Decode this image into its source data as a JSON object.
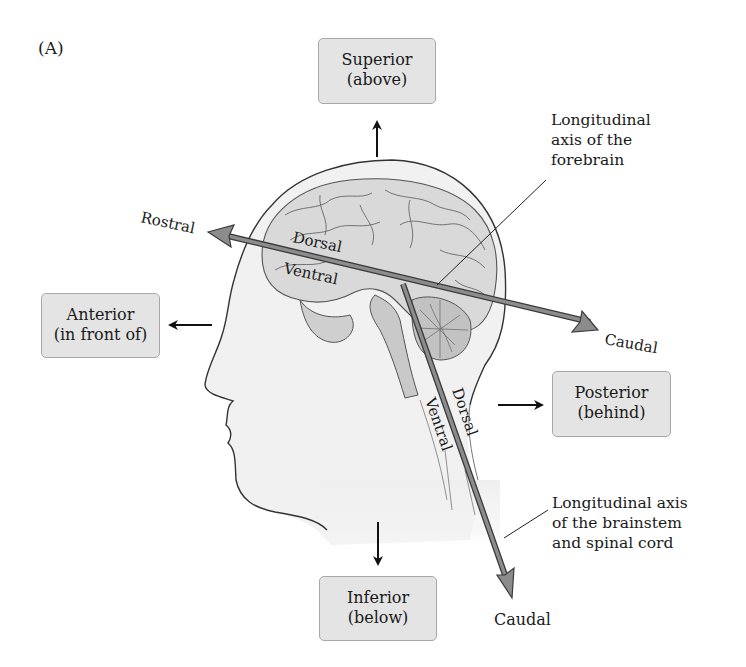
{
  "figure": {
    "panel_label": "(A)",
    "colors": {
      "box_fill": "#e4e4e4",
      "box_border": "#a8a8a8",
      "axis_arrow_fill": "#8c8c8c",
      "axis_arrow_stroke": "#3a3a3a",
      "head_fill": "#f1f1f1",
      "brain_fill": "#d6d6d6",
      "text": "#1a1a1a"
    },
    "direction_boxes": {
      "superior": {
        "title": "Superior",
        "subtitle": "(above)"
      },
      "anterior": {
        "title": "Anterior",
        "subtitle": "(in front of)"
      },
      "posterior": {
        "title": "Posterior",
        "subtitle": "(behind)"
      },
      "inferior": {
        "title": "Inferior",
        "subtitle": "(below)"
      }
    },
    "forebrain_axis": {
      "rostral_label": "Rostral",
      "caudal_label": "Caudal",
      "dorsal_label": "Dorsal",
      "ventral_label": "Ventral",
      "annotation": [
        "Longitudinal",
        "axis of the",
        "forebrain"
      ]
    },
    "brainstem_axis": {
      "dorsal_label": "Dorsal",
      "ventral_label": "Ventral",
      "caudal_label": "Caudal",
      "annotation": [
        "Longitudinal axis",
        "of the brainstem",
        "and spinal cord"
      ]
    }
  }
}
